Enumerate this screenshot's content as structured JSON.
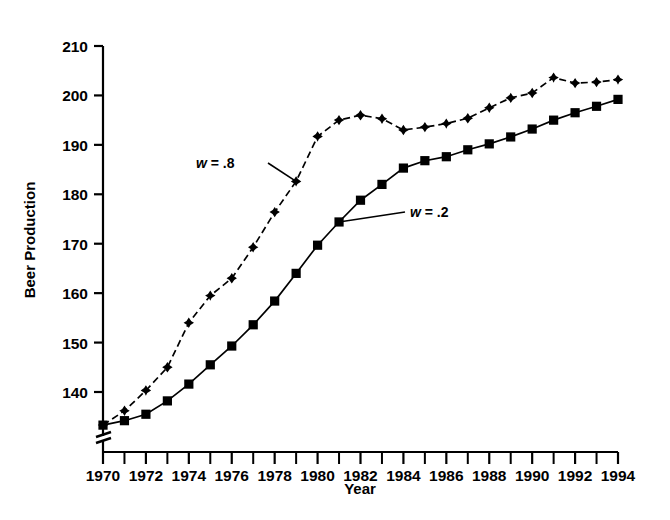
{
  "chart_data": {
    "type": "line",
    "title": "",
    "xlabel": "Year",
    "ylabel": "Beer Production",
    "xlim": [
      1970,
      1994
    ],
    "ylim": [
      133,
      210
    ],
    "ytick_labels": [
      "210",
      "200",
      "190",
      "180",
      "170",
      "160",
      "150",
      "140"
    ],
    "yticks": [
      210,
      200,
      190,
      180,
      170,
      160,
      150,
      140
    ],
    "xtick_labels": [
      "1970",
      "1972",
      "1974",
      "1976",
      "1978",
      "1980",
      "1982",
      "1984",
      "1986",
      "1988",
      "1990",
      "1992",
      "1994"
    ],
    "xticks": [
      1970,
      1972,
      1974,
      1976,
      1978,
      1980,
      1982,
      1984,
      1986,
      1988,
      1990,
      1992,
      1994
    ],
    "minor_xticks": [
      1971,
      1973,
      1975,
      1977,
      1979,
      1981,
      1983,
      1985,
      1987,
      1989,
      1991,
      1993
    ],
    "grid": false,
    "axis_break_y": true,
    "legend_position": "inline-annotations",
    "x": [
      1970,
      1971,
      1972,
      1973,
      1974,
      1975,
      1976,
      1977,
      1978,
      1979,
      1980,
      1981,
      1982,
      1983,
      1984,
      1985,
      1986,
      1987,
      1988,
      1989,
      1990,
      1991,
      1992,
      1993,
      1994
    ],
    "series": [
      {
        "name": "w = .8",
        "marker": "diamond",
        "linestyle": "dashed",
        "color": "#000000",
        "values": [
          133.3,
          136.2,
          140.3,
          145.0,
          154.0,
          159.5,
          163.0,
          169.3,
          176.4,
          182.6,
          191.7,
          195.0,
          196.0,
          195.3,
          193.0,
          193.6,
          194.3,
          195.4,
          197.5,
          199.5,
          200.5,
          203.6,
          202.5,
          202.7,
          203.2
        ]
      },
      {
        "name": "w = .2",
        "marker": "square",
        "linestyle": "solid",
        "color": "#000000",
        "values": [
          133.3,
          134.2,
          135.5,
          138.2,
          141.6,
          145.5,
          149.3,
          153.6,
          158.4,
          164.0,
          169.7,
          174.4,
          178.8,
          182.0,
          185.3,
          186.8,
          187.6,
          189.0,
          190.2,
          191.6,
          193.2,
          195.0,
          196.5,
          197.8,
          199.2
        ]
      }
    ],
    "annotations": [
      {
        "id": "label-w8",
        "text_var": "w",
        "text_rest": " = .8",
        "points_to_year": 1979,
        "points_to_value": 182.6
      },
      {
        "id": "label-w2",
        "text_var": "w",
        "text_rest": " = .2",
        "points_to_year": 1981,
        "points_to_value": 174.4
      }
    ]
  }
}
